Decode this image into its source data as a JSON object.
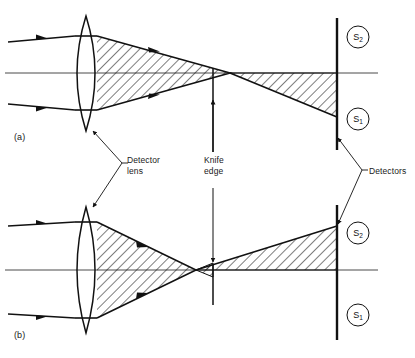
{
  "figure": {
    "panels": [
      {
        "tag": "(a)",
        "description": "Collimated beam focused by detector lens, knife edge at focus, beam falls on detector S1 below axis",
        "beam_target": "S1"
      },
      {
        "tag": "(b)",
        "description": "Collimated beam focused by detector lens, focus before knife edge, beam falls on detector S2 above axis",
        "beam_target": "S2"
      }
    ],
    "labels": {
      "detector_lens": "Detector\nlens",
      "detector_lens_line1": "Detector",
      "detector_lens_line2": "lens",
      "knife_edge_line1": "Knife",
      "knife_edge_line2": "edge",
      "detectors": "Detectors",
      "panel_a": "(a)",
      "panel_b": "(b)"
    },
    "detector_segments": {
      "upper_top": "S2",
      "upper_bottom": "S1",
      "lower_top": "S2",
      "lower_bottom": "S1",
      "s1_base": "S",
      "s1_sub": "1",
      "s2_base": "S",
      "s2_sub": "2"
    },
    "colors": {
      "ink": "#111111",
      "axis": "#3a3a3a",
      "hatch": "#111111",
      "background": "#ffffff"
    }
  }
}
